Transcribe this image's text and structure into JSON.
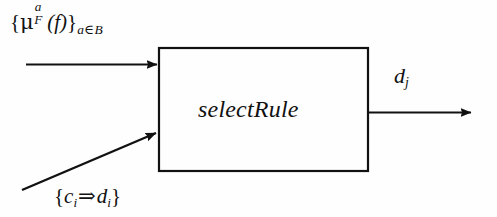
{
  "figure": {
    "type": "block-diagram",
    "width": 497,
    "height": 217,
    "background_color": "#fefefe",
    "stroke_color": "#111111",
    "text_color": "#111111"
  },
  "process_block": {
    "label": "selectRule",
    "x": 158,
    "y": 47,
    "width": 211,
    "height": 125,
    "border_width": 2
  },
  "inputs": {
    "membership": {
      "open_brace": "{",
      "symbol": "μ",
      "superscript": "a",
      "subscript": "F",
      "argument": "(f)",
      "close_brace": "}",
      "qualifier_var": "a",
      "qualifier_op": "∈",
      "qualifier_set": "B",
      "plain_text": "{μ_F^a(f)}_{a∈B}",
      "arrow": "horizontal-arrow-right"
    },
    "rules": {
      "open_brace": "{",
      "antecedent": "c",
      "antecedent_sub": "i",
      "implies": "⇒",
      "consequent": "d",
      "consequent_sub": "i",
      "close_brace": "}",
      "plain_text": "{c_i ⇒ d_i}",
      "arrow": "diagonal-arrow-up-right"
    }
  },
  "outputs": {
    "decision": {
      "symbol": "d",
      "subscript": "j",
      "plain_text": "d_j",
      "arrow": "horizontal-arrow-right"
    }
  }
}
